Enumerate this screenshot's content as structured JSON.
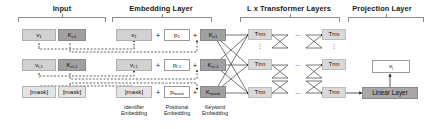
{
  "diagram": {
    "sections": [
      {
        "id": "input",
        "label": "Input"
      },
      {
        "id": "embedding",
        "label": "Embedding Layer"
      },
      {
        "id": "transformer",
        "label": "L x Transformer Layers"
      },
      {
        "id": "projection",
        "label": "Projection Layer"
      }
    ],
    "input_rows": [
      {
        "identifier": "v1",
        "keyword": "Kv1"
      },
      {
        "identifier": "vl-1",
        "keyword": "Kvl-1"
      },
      {
        "identifier": "[mask]",
        "keyword": "[mask]"
      }
    ],
    "embedding_rows": [
      {
        "identifier": "v1",
        "positional": "p1",
        "keyword": "Kv1"
      },
      {
        "identifier": "vl-1",
        "positional": "pl-1",
        "keyword": "Kvl-1"
      },
      {
        "identifier": "[mask]",
        "positional": "pmask",
        "keyword": "Kmask"
      }
    ],
    "embedding_operator": "+",
    "embedding_captions": [
      {
        "line1": "Identifier",
        "line2": "Embedding"
      },
      {
        "line1": "Positional",
        "line2": "Embedding"
      },
      {
        "line1": "Keyword",
        "line2": "Embedding"
      }
    ],
    "transformer_cell_label": "Trm",
    "transformer_ellipsis": "...",
    "vertical_ellipsis": "⋮",
    "projection": {
      "linear_label": "Linear Layer",
      "output_label": "vl"
    },
    "colors": {
      "identifier_box": "#d2d2d2",
      "keyword_box": "#a0a0a0",
      "positional_box": "#ffffff",
      "mask_box": "#e4e4e4",
      "transformer_box": "#d9d9d9",
      "linear_box": "#a8a8a8",
      "stroke": "#4a4a4a",
      "dashed_stroke": "#2b2b2b"
    }
  }
}
